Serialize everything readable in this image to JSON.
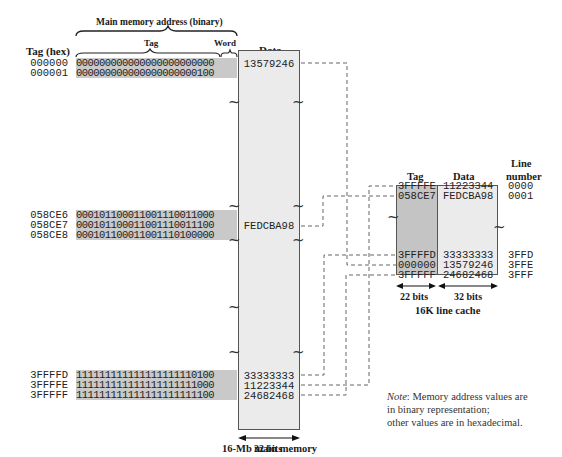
{
  "header": {
    "address_label": "Main memory address (binary)",
    "tag_hex_label": "Tag (hex)",
    "tag_label": "Tag",
    "word_label": "Word",
    "data_label": "Data"
  },
  "main_memory": {
    "rows_top": [
      {
        "tag_hex": "000000",
        "binary": "000000000000000000000000",
        "data": "13579246"
      },
      {
        "tag_hex": "000001",
        "binary": "000000000000000000000100",
        "data": ""
      }
    ],
    "rows_mid": [
      {
        "tag_hex": "058CE6",
        "binary": "000101100011001110011000",
        "data": ""
      },
      {
        "tag_hex": "058CE7",
        "binary": "000101100011001110011100",
        "data": "FEDCBA98"
      },
      {
        "tag_hex": "058CE8",
        "binary": "000101100011001110100000",
        "data": ""
      }
    ],
    "rows_bot": [
      {
        "tag_hex": "3FFFFD",
        "binary": "111111111111111111110100",
        "data": "33333333"
      },
      {
        "tag_hex": "3FFFFE",
        "binary": "111111111111111111111000",
        "data": "11223344"
      },
      {
        "tag_hex": "3FFFFF",
        "binary": "111111111111111111111100",
        "data": "24682468"
      }
    ],
    "width_label": "32 bits",
    "caption": "16-Mb main memory"
  },
  "cache": {
    "tag_header": "Tag",
    "data_header": "Data",
    "line_header_1": "Line",
    "line_header_2": "number",
    "rows_top": [
      {
        "tag": "3FFFFE",
        "data": "11223344",
        "line": "0000"
      },
      {
        "tag": "058CE7",
        "data": "FEDCBA98",
        "line": "0001"
      }
    ],
    "rows_bot": [
      {
        "tag": "3FFFFD",
        "data": "33333333",
        "line": "3FFD"
      },
      {
        "tag": "000000",
        "data": "13579246",
        "line": "3FFE"
      },
      {
        "tag": "3FFFFF",
        "data": "24682468",
        "line": "3FFF"
      }
    ],
    "tag_width_label": "22 bits",
    "data_width_label": "32 bits",
    "caption": "16K line cache"
  },
  "note": {
    "prefix": "Note",
    "line1": ": Memory address values are",
    "line2": "in binary representation;",
    "line3": "other values are in hexadecimal."
  }
}
